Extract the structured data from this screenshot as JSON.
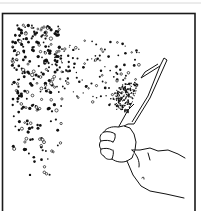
{
  "figure": {
    "caption": "Hand scattering particles with a scoop",
    "frame_color": "#1a1a1a",
    "ink_color": "#111111",
    "background": "#ffffff"
  },
  "particles": {
    "dense_region": {
      "x": [
        12,
        62
      ],
      "y": [
        25,
        150
      ],
      "count": 360
    },
    "sparse_trail": {
      "x": [
        55,
        140
      ],
      "y": [
        40,
        140
      ],
      "count": 150
    },
    "cluster_near_scoop": {
      "x": [
        108,
        146
      ],
      "y": [
        78,
        118
      ],
      "count": 260
    }
  }
}
